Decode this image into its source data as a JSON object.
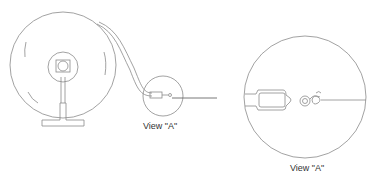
{
  "diagram": {
    "type": "technical-illustration",
    "colors": {
      "line": "#8a8a8a",
      "text": "#333333",
      "background": "#ffffff"
    },
    "callout_small": {
      "label": "View \"A\""
    },
    "detail_view": {
      "label": "View \"A\""
    }
  }
}
